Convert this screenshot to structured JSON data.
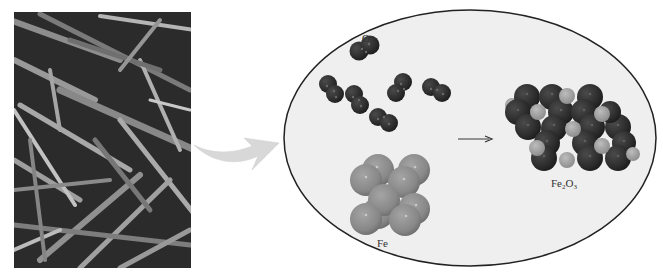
{
  "figure": {
    "photo": {
      "subject": "rusted iron nails",
      "description": "Photograph of a pile of rusty nails"
    },
    "transition_arrow": {
      "icon": "curved-arrow-icon",
      "color": "#d8d8d8"
    },
    "zoom_view": {
      "shape": "ellipse",
      "fill": "#efefef",
      "stroke": "#222222"
    },
    "labels": {
      "o2": {
        "main": "O",
        "sub": "2"
      },
      "fe": {
        "main": "Fe"
      },
      "fe2o3": {
        "main1": "Fe",
        "sub1": "2",
        "main2": "O",
        "sub2": "3"
      }
    },
    "reaction_arrow": {
      "icon": "right-arrow-icon",
      "glyph": "⟶"
    },
    "colors": {
      "oxygen": "#2e2e2e",
      "iron": "#8c8c8c",
      "iron_in_oxide": "#a3a3a3"
    }
  }
}
